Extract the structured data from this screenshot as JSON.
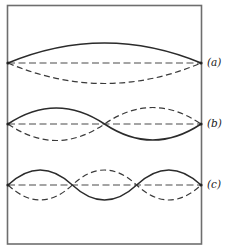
{
  "figure": {
    "colors": {
      "frame": "#6e6e6e",
      "solid_curve": "#2b2b2b",
      "dashed_curve": "#3a3a3a",
      "background": "#ffffff"
    },
    "modes": [
      {
        "id": "a",
        "label": "(a)",
        "loops": 1,
        "baseline_y": 63,
        "amplitude": 20
      },
      {
        "id": "b",
        "label": "(b)",
        "loops": 2,
        "baseline_y": 124,
        "amplitude": 16
      },
      {
        "id": "c",
        "label": "(c)",
        "loops": 3,
        "baseline_y": 185,
        "amplitude": 15
      }
    ]
  }
}
